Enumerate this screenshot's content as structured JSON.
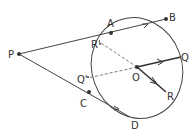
{
  "diagram": {
    "type": "geometry",
    "colors": {
      "stroke": "#444444",
      "background": "#ffffff"
    },
    "ellipse": {
      "cx": 137,
      "cy": 68,
      "rx": 45,
      "ry": 51,
      "rotate": -20
    },
    "points": {
      "P": {
        "label": "P",
        "x": 19,
        "y": 54
      },
      "A": {
        "label": "A",
        "x": 111,
        "y": 33
      },
      "B": {
        "label": "B",
        "x": 166,
        "y": 19
      },
      "C": {
        "label": "C",
        "x": 89,
        "y": 92
      },
      "D": {
        "label": "D",
        "x": 130,
        "y": 117
      },
      "O": {
        "label": "O",
        "x": 137,
        "y": 67
      },
      "Q": {
        "label": "Q",
        "x": 181,
        "y": 57
      },
      "R": {
        "label": "R",
        "x": 166,
        "y": 92
      },
      "Rp": {
        "label": "R'",
        "x": 101,
        "y": 43
      },
      "Qp": {
        "label": "Q'",
        "x": 88,
        "y": 78
      }
    },
    "segments": [
      {
        "from": "P",
        "to": "B",
        "style": "solid",
        "arrow_on": "AB"
      },
      {
        "from": "P",
        "to": "D",
        "style": "solid",
        "arrow_on": "CD"
      },
      {
        "from": "O",
        "to": "Q",
        "style": "solid-bold",
        "arrow": true
      },
      {
        "from": "O",
        "to": "R",
        "style": "solid-bold",
        "arrow": true
      },
      {
        "from": "O",
        "to": "Rp",
        "style": "dashed"
      },
      {
        "from": "O",
        "to": "Qp",
        "style": "dashed"
      }
    ]
  }
}
